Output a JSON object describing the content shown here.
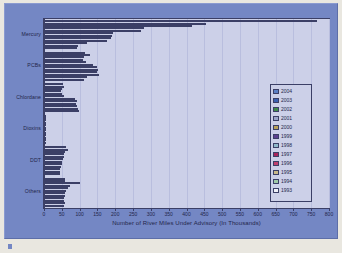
{
  "chart_data": {
    "type": "bar",
    "orientation": "horizontal",
    "title": "",
    "xlabel": "Number of River Miles Under Advisory (In Thousands)",
    "ylabel": "",
    "xlim": [
      0,
      800
    ],
    "xticks": [
      0,
      50,
      100,
      150,
      200,
      250,
      300,
      350,
      400,
      450,
      500,
      550,
      600,
      650,
      700,
      750,
      800
    ],
    "grid": true,
    "legend_position": "right",
    "categories": [
      "Mercury",
      "PCBs",
      "Chlordane",
      "Dioxins",
      "DDT",
      "Others"
    ],
    "series": [
      {
        "name": "2004",
        "color": "#5b7fc4",
        "values": [
          765,
          115,
          52,
          2,
          62,
          60
        ]
      },
      {
        "name": "2003",
        "color": "#3a5fb0",
        "values": [
          455,
          130,
          56,
          2,
          66,
          58
        ]
      },
      {
        "name": "2002",
        "color": "#3f8a4a",
        "values": [
          415,
          112,
          50,
          2,
          60,
          100
        ]
      },
      {
        "name": "2001",
        "color": "#9aa3c8",
        "values": [
          280,
          110,
          48,
          2,
          57,
          72
        ]
      },
      {
        "name": "2000",
        "color": "#b8a05a",
        "values": [
          272,
          118,
          50,
          2,
          55,
          66
        ]
      },
      {
        "name": "1999",
        "color": "#5b3f8f",
        "values": [
          195,
          138,
          55,
          2,
          52,
          62
        ]
      },
      {
        "name": "1998",
        "color": "#8fb7c9",
        "values": [
          190,
          148,
          88,
          2,
          50,
          60
        ]
      },
      {
        "name": "1997",
        "color": "#a8235a",
        "values": [
          188,
          152,
          92,
          2,
          50,
          58
        ]
      },
      {
        "name": "1996",
        "color": "#c0406e",
        "values": [
          178,
          150,
          90,
          2,
          48,
          56
        ]
      },
      {
        "name": "1995",
        "color": "#c9b98a",
        "values": [
          122,
          155,
          92,
          2,
          46,
          55
        ]
      },
      {
        "name": "1994",
        "color": "#9fc9a8",
        "values": [
          96,
          120,
          95,
          2,
          45,
          58
        ]
      },
      {
        "name": "1993",
        "color": "#eef0f8",
        "values": [
          92,
          112,
          98,
          2,
          44,
          56
        ]
      }
    ]
  },
  "legend": {
    "items": [
      {
        "label": "2004"
      },
      {
        "label": "2003"
      },
      {
        "label": "2002"
      },
      {
        "label": "2001"
      },
      {
        "label": "2000"
      },
      {
        "label": "1999"
      },
      {
        "label": "1998"
      },
      {
        "label": "1997"
      },
      {
        "label": "1996"
      },
      {
        "label": "1995"
      },
      {
        "label": "1994"
      },
      {
        "label": "1993"
      }
    ]
  },
  "colors": {
    "figure_background": "#7487c4",
    "plot_background": "#ccd0e8",
    "axis_line": "#3b3f66",
    "gridline": "#b9bede",
    "text": "#23264a",
    "page_background": "#e9e7e0"
  }
}
